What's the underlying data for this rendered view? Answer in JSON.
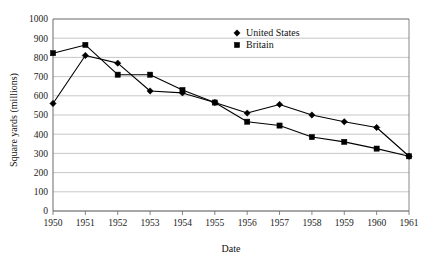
{
  "chart_data": {
    "type": "line",
    "title": "",
    "xlabel": "Date",
    "ylabel": "Square yards (millions)",
    "x": [
      1950,
      1951,
      1952,
      1953,
      1954,
      1955,
      1956,
      1957,
      1958,
      1959,
      1960,
      1961
    ],
    "categories": [
      "1950",
      "1951",
      "1952",
      "1953",
      "1954",
      "1955",
      "1956",
      "1957",
      "1958",
      "1959",
      "1960",
      "1961"
    ],
    "xlim": [
      1950,
      1961
    ],
    "ylim": [
      0,
      1000
    ],
    "yticks": [
      0,
      100,
      200,
      300,
      400,
      500,
      600,
      700,
      800,
      900,
      1000
    ],
    "ytick_labels": [
      "0",
      "100",
      "200",
      "300",
      "400",
      "500",
      "600",
      "700",
      "800",
      "900",
      "1000"
    ],
    "grid": "horizontal",
    "legend_position": "top-right",
    "series": [
      {
        "name": "United States",
        "marker": "diamond",
        "color": "#000000",
        "values": [
          560,
          810,
          770,
          625,
          615,
          565,
          510,
          555,
          500,
          465,
          435,
          285
        ]
      },
      {
        "name": "Britain",
        "marker": "square",
        "color": "#000000",
        "values": [
          822,
          865,
          710,
          710,
          630,
          565,
          465,
          445,
          385,
          360,
          325,
          285
        ]
      }
    ]
  },
  "legend": {
    "entries": [
      {
        "label": "United States",
        "marker": "diamond"
      },
      {
        "label": "Britain",
        "marker": "square"
      }
    ]
  }
}
